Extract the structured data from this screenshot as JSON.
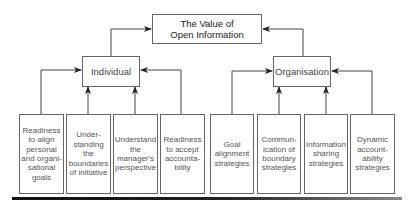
{
  "diagram": {
    "root": {
      "label_line1": "The Value of",
      "label_line2": "Open Information"
    },
    "branches": [
      {
        "label": "Individual",
        "children": [
          {
            "lines": [
              "Readiness",
              "to align",
              "personal",
              "and organi-",
              "sational",
              "goals"
            ]
          },
          {
            "lines": [
              "Under-",
              "standing",
              "the",
              "boundaries",
              "of initiative"
            ]
          },
          {
            "lines": [
              "Understand",
              "the",
              "manager's",
              "perspective"
            ]
          },
          {
            "lines": [
              "Readiness",
              "to accept",
              "accounta-",
              "bility"
            ]
          }
        ]
      },
      {
        "label": "Organisation",
        "children": [
          {
            "lines": [
              "Goal",
              "alignment",
              "strategies"
            ]
          },
          {
            "lines": [
              "Commun-",
              "ication of",
              "boundary",
              "strategies"
            ]
          },
          {
            "lines": [
              "Information",
              "sharing",
              "strategies"
            ]
          },
          {
            "lines": [
              "Dynamic",
              "account-",
              "ability",
              "strategies"
            ]
          }
        ]
      }
    ],
    "colors": {
      "line": "#444444",
      "box_border": "#666666",
      "rule": "#111111"
    }
  }
}
